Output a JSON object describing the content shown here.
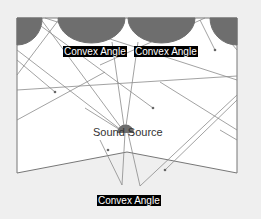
{
  "diagram": {
    "title": "",
    "colors": {
      "background": "#efefef",
      "room_fill": "#ffffff",
      "room_stroke": "#777777",
      "diffuser_fill": "#6e6e6e",
      "ray_color": "#8a8a8a",
      "source_fill": "#6e6e6e",
      "label_bg": "#000000",
      "label_fg": "#ffffff"
    },
    "labels": {
      "top_left": "Convex Angle",
      "top_right": "Convex Angle",
      "source": "Sound Source",
      "bottom": "Convex Angle"
    }
  }
}
